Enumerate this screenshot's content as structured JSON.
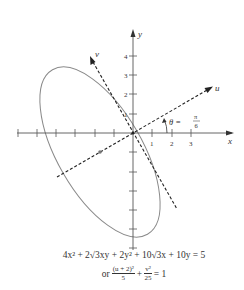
{
  "figure": {
    "axes": {
      "x_label": "x",
      "y_label": "y",
      "x_tick_labels": [
        "1",
        "2",
        "3"
      ],
      "y_tick_labels": [
        "1",
        "2",
        "3",
        "4"
      ],
      "x_range_ticks": [
        -6,
        3
      ],
      "y_range_ticks": [
        -6,
        4
      ]
    },
    "rotated_axes": {
      "u_label": "u",
      "v_label": "v",
      "angle_label_theta": "θ =",
      "angle_numerator": "π",
      "angle_denominator": "6"
    },
    "ellipse": {
      "center_uv": [
        -2,
        0
      ],
      "semi_axis_u": 2.236,
      "semi_axis_v": 5,
      "center_xy": [
        -1.732,
        -1
      ]
    },
    "colors": {
      "axis": "#555555",
      "ellipse": "#8a8a8a",
      "dashed": "#222222",
      "text": "#333333"
    }
  },
  "equations": {
    "line1": "4x² + 2√3xy + 2y² + 10√3x + 10y = 5",
    "line2_prefix": "or",
    "frac1_num": "(u + 2)²",
    "frac1_den": "5",
    "plus": "+",
    "frac2_num": "v²",
    "frac2_den": "25",
    "rhs": "= 1"
  }
}
